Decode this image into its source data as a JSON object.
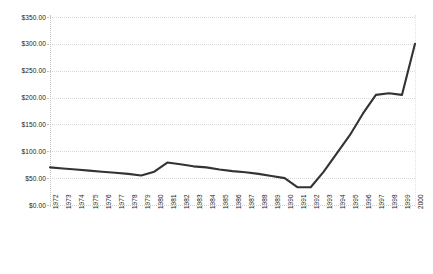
{
  "chart_data": {
    "type": "line",
    "title": "",
    "subtitle": "",
    "xlabel": "",
    "ylabel": "",
    "grid": true,
    "legend": false,
    "legend_position": "none",
    "line_color": "#333333",
    "categories": [
      "1972",
      "1973",
      "1974",
      "1975",
      "1976",
      "1977",
      "1978",
      "1979",
      "1980",
      "1981",
      "1982",
      "1983",
      "1984",
      "1985",
      "1986",
      "1987",
      "1988",
      "1989",
      "1990",
      "1991",
      "1992",
      "1993",
      "1994",
      "1995",
      "1996",
      "1997",
      "1998",
      "1999",
      "2000"
    ],
    "values": [
      70,
      68,
      66,
      64,
      62,
      60,
      58,
      55,
      62,
      79,
      76,
      72,
      70,
      66,
      63,
      61,
      58,
      54,
      50,
      33,
      33,
      62,
      96,
      130,
      170,
      205,
      208,
      205,
      300
    ],
    "ylim": [
      0,
      350
    ],
    "ytick_values": [
      0,
      50,
      100,
      150,
      200,
      250,
      300,
      350
    ],
    "ytick_labels": [
      "$0.00",
      "$50.00",
      "$100.00",
      "$150.00",
      "$200.00",
      "$250.00",
      "$300.00",
      "$350.00"
    ],
    "series": [
      {
        "name": "series-1",
        "values": [
          70,
          68,
          66,
          64,
          62,
          60,
          58,
          55,
          62,
          79,
          76,
          72,
          70,
          66,
          63,
          61,
          58,
          54,
          50,
          33,
          33,
          62,
          96,
          130,
          170,
          205,
          208,
          205,
          300
        ]
      }
    ]
  }
}
